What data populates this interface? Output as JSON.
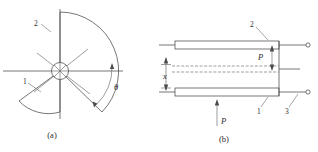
{
  "figure": {
    "panels": [
      {
        "id": "panel-a",
        "caption": "(a)",
        "labels": {
          "part_one": "1",
          "part_two": "2",
          "angle": "θ"
        }
      },
      {
        "id": "panel-b",
        "caption": "(b)",
        "labels": {
          "part_one": "1",
          "part_two": "2",
          "part_three": "3",
          "dimension_x": "x",
          "force_upper": "P",
          "force_lower": "P"
        }
      }
    ],
    "colors": {
      "line": "#4a4a4a",
      "thin_line": "#5a5a5a",
      "leader": "#6a6a6a",
      "text": "#2b2b2b",
      "background": "#ffffff"
    }
  }
}
